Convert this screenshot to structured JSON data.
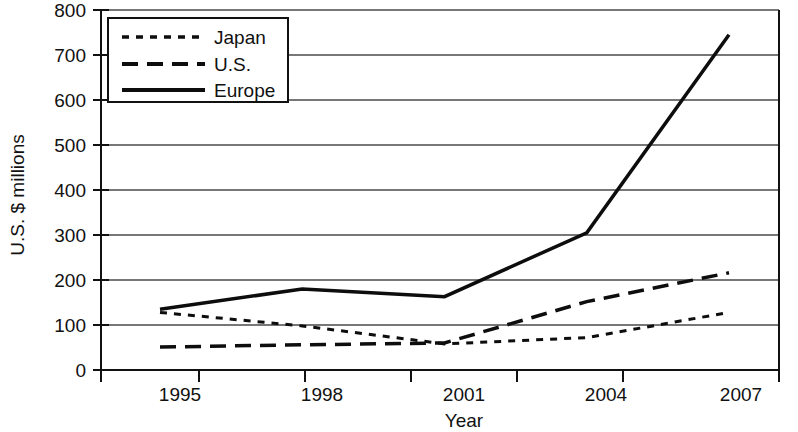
{
  "chart_data": {
    "type": "line",
    "title": "",
    "xlabel": "Year",
    "ylabel": "U.S. $ millions",
    "x": [
      1995,
      1998,
      2001,
      2004,
      2007
    ],
    "categories": [
      "1995",
      "1998",
      "2001",
      "2004",
      "2007"
    ],
    "xtick_labels": [
      "1995",
      "1998",
      "2001",
      "2004",
      "2007"
    ],
    "ytick_labels": [
      "0",
      "100",
      "200",
      "300",
      "400",
      "500",
      "600",
      "700",
      "800"
    ],
    "ytick_values": [
      0,
      100,
      200,
      300,
      400,
      500,
      600,
      700,
      800
    ],
    "ylim": [
      0,
      800
    ],
    "grid": "horizontal",
    "legend_position": "top-left",
    "series": [
      {
        "name": "Japan",
        "style": "dotted",
        "values": [
          128,
          98,
          58,
          72,
          128
        ]
      },
      {
        "name": "U.S.",
        "style": "dashed",
        "values": [
          51,
          56,
          60,
          152,
          216
        ]
      },
      {
        "name": "Europe",
        "style": "solid",
        "values": [
          135,
          180,
          163,
          305,
          745
        ]
      }
    ],
    "colors": {
      "axis": "#111111",
      "grid": "#4a4a4a",
      "series": "#0d0d0d",
      "background": "#ffffff"
    }
  },
  "axes": {
    "y_title": "U.S. $ millions",
    "x_title": "Year",
    "y_ticks": [
      {
        "label": "800",
        "value": 800
      },
      {
        "label": "700",
        "value": 700
      },
      {
        "label": "600",
        "value": 600
      },
      {
        "label": "500",
        "value": 500
      },
      {
        "label": "400",
        "value": 400
      },
      {
        "label": "300",
        "value": 300
      },
      {
        "label": "200",
        "value": 200
      },
      {
        "label": "100",
        "value": 100
      },
      {
        "label": "0",
        "value": 0
      }
    ],
    "x_ticks": [
      {
        "label": "1995"
      },
      {
        "label": "1998"
      },
      {
        "label": "2001"
      },
      {
        "label": "2004"
      },
      {
        "label": "2007"
      }
    ]
  },
  "legend": {
    "entries": [
      {
        "label": "Japan",
        "style": "dotted"
      },
      {
        "label": "U.S.",
        "style": "dashed"
      },
      {
        "label": "Europe",
        "style": "solid"
      }
    ]
  }
}
